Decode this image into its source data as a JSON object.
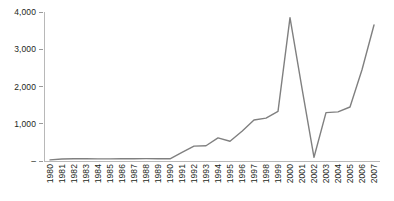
{
  "chart_data": {
    "type": "line",
    "title": "",
    "subtitle": "",
    "xlabel": "",
    "ylabel": "",
    "grid": false,
    "legend": false,
    "legend_position": "none",
    "line_color": "#808080",
    "categories": [
      "1980",
      "1981",
      "1982",
      "1983",
      "1984",
      "1985",
      "1986",
      "1987",
      "1988",
      "1989",
      "1990",
      "1991",
      "1992",
      "1993",
      "1994",
      "1995",
      "1996",
      "1997",
      "1998",
      "1999",
      "2000",
      "2001",
      "2002",
      "2003",
      "2004",
      "2005",
      "2006",
      "2007"
    ],
    "values": [
      30,
      55,
      60,
      60,
      58,
      58,
      60,
      62,
      65,
      62,
      60,
      230,
      400,
      410,
      620,
      530,
      800,
      1100,
      1150,
      1330,
      3850,
      1950,
      100,
      1300,
      1320,
      1450,
      2450,
      3650
    ],
    "ylim": [
      0,
      4000
    ],
    "yticks": [
      0,
      1000,
      2000,
      3000,
      4000
    ],
    "ytick_labels": [
      "–",
      "1,000",
      "2,000",
      "3,000",
      "4,000"
    ],
    "xtick_labels": [
      "1980",
      "1981",
      "1982",
      "1983",
      "1984",
      "1985",
      "1986",
      "1987",
      "1988",
      "1989",
      "1990",
      "1991",
      "1992",
      "1993",
      "1994",
      "1995",
      "1996",
      "1997",
      "1998",
      "1999",
      "2000",
      "2001",
      "2002",
      "2003",
      "2004",
      "2005",
      "2006",
      "2007"
    ],
    "series": [
      {
        "name": "",
        "values": [
          30,
          55,
          60,
          60,
          58,
          58,
          60,
          62,
          65,
          62,
          60,
          230,
          400,
          410,
          620,
          530,
          800,
          1100,
          1150,
          1330,
          3850,
          1950,
          100,
          1300,
          1320,
          1450,
          2450,
          3650
        ]
      }
    ]
  }
}
